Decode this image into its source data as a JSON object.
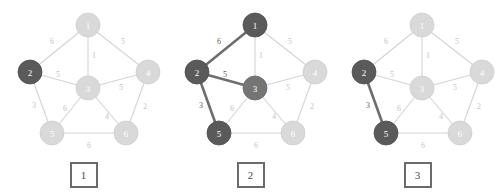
{
  "figure": {
    "type": "graph-sequence",
    "panel_count": 3,
    "colors": {
      "node_light": "#d9d9d9",
      "node_mid": "#757575",
      "node_dark": "#5a5a5a",
      "edge_normal": "#d4d4d4",
      "edge_highlight": "#6e6e6e",
      "weight_normal": "#c3c3c3",
      "weight_highlight": "#5d5d5d",
      "caption_border": "#6b6b6b",
      "background": "#ffffff"
    }
  },
  "graph": {
    "nodes": [
      {
        "id": "1",
        "label": "1",
        "x": 88,
        "y": 25
      },
      {
        "id": "2",
        "label": "2",
        "x": 30,
        "y": 72
      },
      {
        "id": "3",
        "label": "3",
        "x": 88,
        "y": 88
      },
      {
        "id": "4",
        "label": "4",
        "x": 148,
        "y": 72
      },
      {
        "id": "5",
        "label": "5",
        "x": 52,
        "y": 133
      },
      {
        "id": "6",
        "label": "6",
        "x": 126,
        "y": 133
      }
    ],
    "node_radius": 12,
    "edges": [
      {
        "id": "e12",
        "from": "1",
        "to": "2",
        "weight": "6",
        "lx": 52,
        "ly": 42
      },
      {
        "id": "e13",
        "from": "1",
        "to": "3",
        "weight": "1",
        "lx": 94,
        "ly": 56
      },
      {
        "id": "e14",
        "from": "1",
        "to": "4",
        "weight": "5",
        "lx": 123,
        "ly": 42
      },
      {
        "id": "e23",
        "from": "2",
        "to": "3",
        "weight": "5",
        "lx": 58,
        "ly": 75
      },
      {
        "id": "e25",
        "from": "2",
        "to": "5",
        "weight": "3",
        "lx": 34,
        "ly": 106
      },
      {
        "id": "e34",
        "from": "3",
        "to": "4",
        "weight": "5",
        "lx": 121,
        "ly": 88
      },
      {
        "id": "e35",
        "from": "3",
        "to": "5",
        "weight": "6",
        "lx": 65,
        "ly": 109
      },
      {
        "id": "e36",
        "from": "3",
        "to": "6",
        "weight": "4",
        "lx": 107,
        "ly": 117
      },
      {
        "id": "e46",
        "from": "4",
        "to": "6",
        "weight": "2",
        "lx": 145,
        "ly": 107
      },
      {
        "id": "e56",
        "from": "5",
        "to": "6",
        "weight": "6",
        "lx": 89,
        "ly": 146
      }
    ]
  },
  "panels": [
    {
      "name": "panel-1",
      "caption": "1",
      "node_states": {
        "1": "light",
        "2": "dark",
        "3": "light",
        "4": "light",
        "5": "light",
        "6": "light"
      },
      "highlighted_edges": []
    },
    {
      "name": "panel-2",
      "caption": "2",
      "node_states": {
        "1": "dark",
        "2": "dark",
        "3": "mid",
        "4": "light",
        "5": "dark",
        "6": "light"
      },
      "highlighted_edges": [
        "e12",
        "e23",
        "e25"
      ]
    },
    {
      "name": "panel-3",
      "caption": "3",
      "node_states": {
        "1": "light",
        "2": "dark",
        "3": "light",
        "4": "light",
        "5": "dark",
        "6": "light"
      },
      "highlighted_edges": [
        "e25"
      ]
    }
  ]
}
